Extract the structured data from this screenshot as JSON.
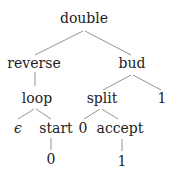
{
  "diagram": {
    "type": "tree",
    "nodes": [
      {
        "id": "n0",
        "label": "double"
      },
      {
        "id": "n1",
        "label": "reverse"
      },
      {
        "id": "n2",
        "label": "bud"
      },
      {
        "id": "n3",
        "label": "loop"
      },
      {
        "id": "n4",
        "label": "split"
      },
      {
        "id": "n5",
        "label": "1"
      },
      {
        "id": "n6",
        "label": "ϵ"
      },
      {
        "id": "n7",
        "label": "start"
      },
      {
        "id": "n8",
        "label": "0"
      },
      {
        "id": "n9",
        "label": "accept"
      },
      {
        "id": "n10",
        "label": "0"
      },
      {
        "id": "n11",
        "label": "1"
      }
    ],
    "edges": [
      [
        "n0",
        "n1"
      ],
      [
        "n0",
        "n2"
      ],
      [
        "n1",
        "n3"
      ],
      [
        "n2",
        "n4"
      ],
      [
        "n2",
        "n5"
      ],
      [
        "n3",
        "n6"
      ],
      [
        "n3",
        "n7"
      ],
      [
        "n4",
        "n8"
      ],
      [
        "n4",
        "n9"
      ],
      [
        "n7",
        "n10"
      ],
      [
        "n9",
        "n11"
      ]
    ]
  }
}
